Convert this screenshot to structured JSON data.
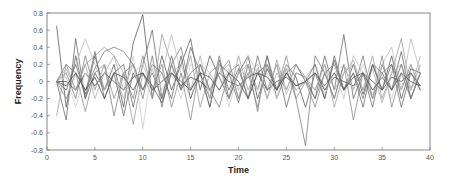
{
  "chart_data": {
    "type": "line",
    "title": "",
    "xlabel": "Time",
    "ylabel": "Frequency",
    "xlim": [
      0,
      40
    ],
    "ylim": [
      -0.8,
      0.8
    ],
    "x_ticks": [
      0,
      5,
      10,
      15,
      20,
      25,
      30,
      35,
      40
    ],
    "y_ticks": [
      0.8,
      0.6,
      0.4,
      0.2,
      0,
      -0.2,
      -0.4,
      -0.6,
      -0.8
    ],
    "y_tick_labels": [
      "0.8",
      "0.6",
      "0.4",
      "0.2",
      "0",
      "-0.2",
      "-0.4",
      "-0.6",
      "-0.8"
    ],
    "grid": false,
    "legend": null,
    "x": [
      1,
      2,
      3,
      4,
      5,
      6,
      7,
      8,
      9,
      10,
      11,
      12,
      13,
      14,
      15,
      16,
      17,
      18,
      19,
      20,
      21,
      22,
      23,
      24,
      25,
      26,
      27,
      28,
      29,
      30,
      31,
      32,
      33,
      34,
      35,
      36,
      37,
      38,
      39
    ],
    "series": [
      {
        "name": "s1",
        "color": "#555555",
        "values": [
          0.65,
          -0.3,
          0.3,
          -0.2,
          0.1,
          -0.1,
          0.2,
          -0.3,
          0.45,
          0.78,
          -0.2,
          0.3,
          -0.1,
          0.2,
          0.5,
          -0.1,
          0.3,
          0.05,
          -0.2,
          0.1,
          0.3,
          -0.2,
          0.15,
          -0.1,
          0.2,
          0.05,
          -0.3,
          0.1,
          -0.2,
          0.25,
          -0.1,
          0.2,
          -0.15,
          0.2,
          -0.1,
          0.3,
          -0.2,
          0.15,
          0.1
        ]
      },
      {
        "name": "s2",
        "color": "#666666",
        "values": [
          0.0,
          -0.45,
          0.5,
          -0.2,
          0.3,
          -0.1,
          0.1,
          0.2,
          -0.3,
          0.2,
          0.6,
          -0.2,
          0.3,
          -0.1,
          0.4,
          0.1,
          -0.3,
          0.25,
          -0.1,
          0.15,
          -0.2,
          0.3,
          -0.1,
          0.2,
          -0.3,
          0.1,
          0.05,
          -0.2,
          0.3,
          -0.1,
          0.55,
          -0.2,
          0.1,
          -0.3,
          0.2,
          -0.1,
          0.35,
          -0.2,
          0.1
        ]
      },
      {
        "name": "s3",
        "color": "#777777",
        "values": [
          0.0,
          0.1,
          -0.2,
          0.3,
          -0.1,
          0.2,
          -0.4,
          0.1,
          0.2,
          -0.2,
          0.3,
          -0.3,
          0.2,
          0.4,
          -0.1,
          0.1,
          -0.2,
          0.3,
          -0.2,
          0.1,
          0.2,
          -0.35,
          0.3,
          -0.1,
          0.15,
          -0.2,
          -0.75,
          0.3,
          0.1,
          -0.2,
          0.2,
          -0.1,
          0.3,
          -0.2,
          0.1,
          0.2,
          -0.1,
          0.2,
          -0.1
        ]
      },
      {
        "name": "s4",
        "color": "#999999",
        "values": [
          -0.4,
          0.2,
          -0.1,
          0.2,
          0.3,
          0.4,
          0.3,
          0.1,
          -0.5,
          0.1,
          -0.2,
          0.55,
          0.2,
          -0.1,
          0.3,
          -0.3,
          0.1,
          0.2,
          -0.2,
          0.3,
          -0.1,
          0.15,
          -0.2,
          0.25,
          -0.1,
          0.2,
          0.05,
          -0.1,
          0.2,
          -0.3,
          0.1,
          0.2,
          -0.1,
          0.3,
          -0.2,
          0.1,
          0.5,
          -0.1,
          0.2
        ]
      },
      {
        "name": "s5",
        "color": "#bbbbbb",
        "values": [
          0.0,
          0.1,
          0.2,
          0.5,
          0.2,
          -0.1,
          0.1,
          -0.2,
          0.1,
          0.2,
          -0.1,
          0.1,
          0.55,
          0.1,
          -0.2,
          0.2,
          0.1,
          -0.1,
          0.15,
          -0.2,
          0.3,
          0.1,
          -0.1,
          0.2,
          -0.15,
          0.1,
          0.05,
          0.2,
          -0.1,
          0.1,
          -0.2,
          0.3,
          0.1,
          -0.2,
          0.2,
          0.4,
          -0.1,
          0.5,
          0.1
        ]
      },
      {
        "name": "s6",
        "color": "#444444",
        "values": [
          0.0,
          0.0,
          -0.1,
          0.1,
          -0.05,
          0.1,
          0.0,
          -0.1,
          0.05,
          0.1,
          -0.1,
          0.0,
          0.1,
          -0.05,
          0.05,
          0.0,
          -0.1,
          0.1,
          0.0,
          -0.05,
          0.05,
          0.1,
          -0.1,
          0.0,
          0.05,
          -0.05,
          0.0,
          0.1,
          -0.1,
          0.05,
          0.0,
          -0.05,
          0.1,
          0.0,
          -0.1,
          0.05,
          0.0,
          0.1,
          -0.05
        ]
      },
      {
        "name": "s7",
        "color": "#888888",
        "values": [
          0.0,
          -0.2,
          0.1,
          -0.35,
          0.1,
          0.2,
          -0.2,
          0.1,
          -0.2,
          0.3,
          -0.1,
          0.2,
          -0.3,
          0.1,
          -0.45,
          0.2,
          -0.1,
          0.1,
          0.25,
          -0.2,
          0.1,
          -0.3,
          0.2,
          -0.1,
          0.3,
          -0.2,
          0.0,
          -0.3,
          0.1,
          -0.2,
          0.2,
          -0.45,
          0.1,
          -0.2,
          0.3,
          -0.3,
          0.1,
          -0.2,
          0.1
        ]
      },
      {
        "name": "s8",
        "color": "#aaaaaa",
        "values": [
          0.0,
          0.15,
          -0.1,
          0.2,
          -0.2,
          0.1,
          0.3,
          -0.1,
          0.2,
          -0.1,
          0.15,
          -0.2,
          0.1,
          0.2,
          -0.1,
          0.3,
          -0.2,
          0.1,
          0.2,
          -0.1,
          0.1,
          0.2,
          -0.2,
          0.1,
          -0.1,
          0.2,
          0.0,
          -0.1,
          0.2,
          -0.1,
          0.1,
          0.25,
          -0.1,
          0.15,
          -0.25,
          0.1,
          0.2,
          -0.1,
          0.3
        ]
      },
      {
        "name": "s9",
        "color": "#666666",
        "values": [
          0.0,
          -0.1,
          0.2,
          -0.15,
          0.35,
          -0.2,
          0.1,
          -0.4,
          0.1,
          -0.1,
          0.2,
          0.1,
          -0.2,
          0.3,
          -0.2,
          0.1,
          -0.3,
          0.2,
          0.1,
          -0.25,
          0.2,
          -0.1,
          0.3,
          -0.2,
          0.1,
          -0.1,
          0.0,
          0.2,
          -0.2,
          0.3,
          -0.1,
          0.1,
          -0.3,
          0.2,
          -0.1,
          0.2,
          -0.3,
          0.1,
          -0.1
        ]
      },
      {
        "name": "s10",
        "color": "#cccccc",
        "values": [
          0.0,
          0.05,
          -0.3,
          0.1,
          -0.1,
          0.2,
          0.1,
          -0.2,
          0.3,
          -0.55,
          0.2,
          -0.1,
          0.1,
          -0.2,
          0.2,
          0.05,
          -0.1,
          0.2,
          -0.3,
          0.1,
          0.2,
          -0.1,
          0.1,
          -0.2,
          0.2,
          -0.1,
          0.0,
          0.1,
          -0.15,
          0.1,
          0.2,
          -0.1,
          0.2,
          -0.1,
          0.1,
          -0.2,
          0.2,
          -0.1,
          0.1
        ]
      },
      {
        "name": "s11",
        "color": "#777777",
        "values": [
          0.0,
          0.2,
          0.1,
          -0.1,
          0.15,
          0.35,
          0.4,
          0.35,
          0.2,
          -0.1,
          0.1,
          -0.2,
          0.2,
          -0.1,
          0.1,
          0.2,
          -0.1,
          -0.3,
          0.1,
          0.2,
          -0.2,
          0.1,
          0.2,
          -0.1,
          0.1,
          0.2,
          0.0,
          -0.2,
          0.1,
          0.2,
          -0.1,
          0.1,
          -0.2,
          0.2,
          0.1,
          -0.1,
          0.2,
          -0.2,
          0.1
        ]
      },
      {
        "name": "s12",
        "color": "#505050",
        "values": [
          0.0,
          -0.05,
          0.1,
          -0.1,
          0.05,
          -0.2,
          0.1,
          0.05,
          -0.1,
          0.1,
          -0.05,
          -0.25,
          0.1,
          0.0,
          -0.1,
          0.1,
          0.05,
          -0.1,
          0.1,
          0.0,
          -0.2,
          0.1,
          0.05,
          -0.1,
          0.1,
          -0.05,
          0.0,
          0.1,
          -0.05,
          0.1,
          -0.1,
          0.05,
          0.1,
          -0.1,
          0.05,
          -0.1,
          0.1,
          0.0,
          -0.05
        ]
      }
    ]
  },
  "axes": {
    "xlabel": "Time",
    "ylabel": "Frequency"
  }
}
